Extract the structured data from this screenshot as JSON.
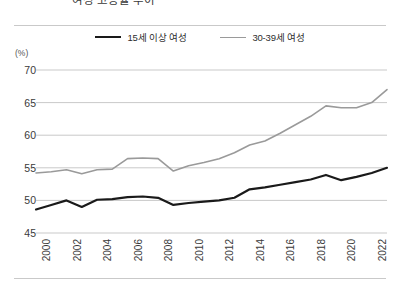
{
  "figure": {
    "unit_label": "(%)",
    "title_fragment": "여성 고용률 추이"
  },
  "legend": {
    "position": "top-center",
    "items": [
      {
        "label": "15세 이상 여성",
        "color": "#1a1a1a"
      },
      {
        "label": "30-39세 여성",
        "color": "#9a9a9a"
      }
    ]
  },
  "axes": {
    "y_ticks": [
      "70",
      "65",
      "60",
      "55",
      "50",
      "45"
    ],
    "x_ticks": [
      "2000",
      "2002",
      "2004",
      "2006",
      "2008",
      "2010",
      "2012",
      "2014",
      "2016",
      "2018",
      "2020",
      "2022"
    ]
  },
  "chart_data": {
    "type": "line",
    "title": "",
    "xlabel": "",
    "ylabel": "(%)",
    "ylim": [
      45,
      70
    ],
    "xlim": [
      2000,
      2023
    ],
    "grid": true,
    "legend_position": "top-center",
    "x": [
      2000,
      2001,
      2002,
      2003,
      2004,
      2005,
      2006,
      2007,
      2008,
      2009,
      2010,
      2011,
      2012,
      2013,
      2014,
      2015,
      2016,
      2017,
      2018,
      2019,
      2020,
      2021,
      2022,
      2023
    ],
    "categories": [
      "2000",
      "2001",
      "2002",
      "2003",
      "2004",
      "2005",
      "2006",
      "2007",
      "2008",
      "2009",
      "2010",
      "2011",
      "2012",
      "2013",
      "2014",
      "2015",
      "2016",
      "2017",
      "2018",
      "2019",
      "2020",
      "2021",
      "2022",
      "2023"
    ],
    "series": [
      {
        "name": "15세 이상 여성",
        "color": "#1a1a1a",
        "width": 2.2,
        "values": [
          48.6,
          49.3,
          50.0,
          49.0,
          50.1,
          50.2,
          50.5,
          50.6,
          50.4,
          49.3,
          49.6,
          49.8,
          50.0,
          50.4,
          51.7,
          52.0,
          52.4,
          52.8,
          53.2,
          53.9,
          53.1,
          53.6,
          54.2,
          55.0
        ]
      },
      {
        "name": "30-39세 여성",
        "color": "#9a9a9a",
        "width": 1.6,
        "values": [
          54.2,
          54.4,
          54.7,
          54.1,
          54.7,
          54.8,
          56.4,
          56.5,
          56.4,
          54.5,
          55.3,
          55.8,
          56.4,
          57.3,
          58.5,
          59.1,
          60.3,
          61.6,
          62.9,
          64.5,
          64.2,
          64.2,
          65.0,
          67.0
        ]
      }
    ],
    "ytick_values": [
      70,
      65,
      60,
      55,
      50,
      45
    ],
    "xtick_values": [
      2000,
      2002,
      2004,
      2006,
      2008,
      2010,
      2012,
      2014,
      2016,
      2018,
      2020,
      2022
    ]
  }
}
